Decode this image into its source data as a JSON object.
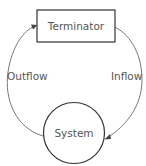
{
  "diagram": {
    "type": "context-diagram",
    "nodes": [
      {
        "id": "terminator",
        "label": "Terminator",
        "shape": "rectangle"
      },
      {
        "id": "system",
        "label": "System",
        "shape": "circle"
      }
    ],
    "edges": [
      {
        "id": "outflow",
        "label": "Outflow",
        "from": "system",
        "to": "terminator"
      },
      {
        "id": "inflow",
        "label": "Inflow",
        "from": "terminator",
        "to": "system"
      }
    ],
    "colors": {
      "stroke": "#333333",
      "text": "#555555",
      "background": "#ffffff"
    }
  }
}
